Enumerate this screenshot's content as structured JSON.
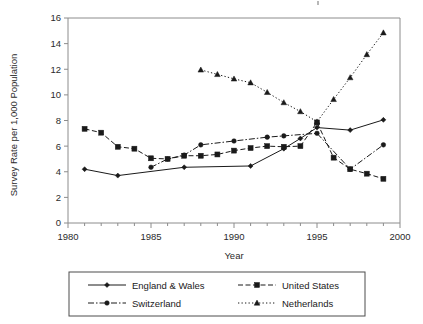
{
  "chart_data": {
    "type": "line",
    "title": "",
    "xlabel": "Year",
    "ylabel": "Survey Rate per 1,000 Population",
    "xlim": [
      1980,
      2000
    ],
    "ylim": [
      0,
      16
    ],
    "ytick_step": 2,
    "yticks": [
      0,
      2,
      4,
      6,
      8,
      10,
      12,
      14,
      16
    ],
    "xticks": [
      1980,
      1985,
      1990,
      1995,
      2000
    ],
    "xtick_minor_step": 1,
    "grid": false,
    "legend_position": "below",
    "series": [
      {
        "name": "England & Wales",
        "marker": "diamond",
        "dash": "solid",
        "x": [
          1981,
          1983,
          1987,
          1991,
          1993,
          1994,
          1995,
          1997,
          1999
        ],
        "values": [
          4.2,
          3.7,
          4.35,
          4.45,
          5.8,
          6.6,
          7.45,
          7.25,
          8.05
        ]
      },
      {
        "name": "United States",
        "marker": "square",
        "dash": "dashed",
        "x": [
          1981,
          1982,
          1983,
          1984,
          1985,
          1986,
          1987,
          1988,
          1989,
          1990,
          1991,
          1992,
          1993,
          1994,
          1995,
          1996,
          1997,
          1998,
          1999
        ],
        "values": [
          7.35,
          7.05,
          5.95,
          5.8,
          5.05,
          5.0,
          5.25,
          5.25,
          5.35,
          5.65,
          5.85,
          6.0,
          5.95,
          6.0,
          7.85,
          5.1,
          4.2,
          3.85,
          3.45
        ]
      },
      {
        "name": "Switzerland",
        "marker": "circle",
        "dash": "dashdot",
        "x": [
          1985,
          1986,
          1987,
          1988,
          1990,
          1992,
          1993,
          1995,
          1997,
          1999
        ],
        "values": [
          4.35,
          5.0,
          5.3,
          6.1,
          6.4,
          6.7,
          6.8,
          7.0,
          4.2,
          6.1
        ]
      },
      {
        "name": "Netherlands",
        "marker": "triangle",
        "dash": "dotted",
        "x": [
          1988,
          1989,
          1990,
          1991,
          1992,
          1993,
          1994,
          1995,
          1996,
          1997,
          1998,
          1999
        ],
        "values": [
          11.95,
          11.6,
          11.25,
          10.95,
          10.2,
          9.4,
          8.7,
          7.9,
          9.65,
          11.35,
          13.15,
          14.85
        ]
      }
    ]
  },
  "legend": {
    "entries": [
      {
        "label": "England & Wales"
      },
      {
        "label": "United States"
      },
      {
        "label": "Switzerland"
      },
      {
        "label": "Netherlands"
      }
    ]
  },
  "colors": {
    "ink": "#1a1a1a",
    "axis": "#8c8c8c",
    "legend_border": "#4d4d4d",
    "background": "#ffffff"
  }
}
